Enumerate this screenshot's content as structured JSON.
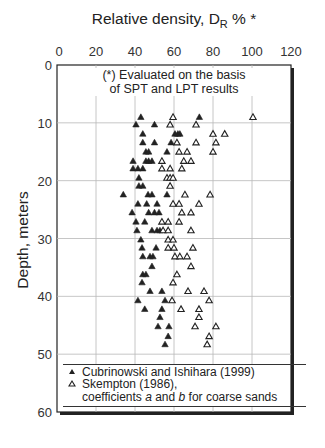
{
  "chart_data": {
    "type": "scatter",
    "title_main": "Relative density, D",
    "title_sub": "R",
    "title_suffix": " % *",
    "xlabel": "Relative density, D_R % *",
    "ylabel": "Depth, meters",
    "xlim": [
      0,
      120
    ],
    "ylim": [
      60,
      0
    ],
    "x_axis_position": "top",
    "y_inverted": true,
    "xticks": [
      0,
      20,
      40,
      60,
      80,
      100,
      120
    ],
    "yticks": [
      0,
      10,
      20,
      30,
      40,
      50,
      60
    ],
    "grid": true,
    "annotation": [
      "(*) Evaluated on the basis",
      "of SPT and LPT results"
    ],
    "legend_position": "bottom-inside",
    "legend": [
      {
        "marker": "filled-triangle",
        "label": "Cubrinowski and Ishihara (1999)"
      },
      {
        "marker": "hollow-triangle",
        "label": "Skempton (1986),",
        "label2_parts": [
          "coefficients ",
          "a",
          " and ",
          "b",
          " for coarse sands"
        ]
      }
    ],
    "series": [
      {
        "name": "Cubrinowski and Ishihara (1999)",
        "marker": "filled-triangle",
        "color": "#222222",
        "points": [
          [
            43,
            9.0
          ],
          [
            73,
            9.0
          ],
          [
            40.5,
            10.3
          ],
          [
            50,
            10.3
          ],
          [
            44,
            11.9
          ],
          [
            60.5,
            11.9
          ],
          [
            62,
            11.9
          ],
          [
            63,
            11.9
          ],
          [
            44,
            13.4
          ],
          [
            50,
            13.4
          ],
          [
            58.5,
            13.4
          ],
          [
            45.6,
            15.0
          ],
          [
            47,
            15.0
          ],
          [
            56.4,
            15.0
          ],
          [
            39,
            16.6
          ],
          [
            45.6,
            16.6
          ],
          [
            47,
            16.6
          ],
          [
            48.7,
            16.6
          ],
          [
            39,
            17.9
          ],
          [
            41.5,
            17.9
          ],
          [
            44,
            17.9
          ],
          [
            42,
            19.5
          ],
          [
            42,
            20.9
          ],
          [
            44,
            20.9
          ],
          [
            34,
            22.4
          ],
          [
            46.7,
            22.4
          ],
          [
            48.7,
            22.4
          ],
          [
            56.4,
            22.4
          ],
          [
            41.5,
            24.0
          ],
          [
            46,
            24.0
          ],
          [
            51.3,
            24.0
          ],
          [
            38.5,
            25.5
          ],
          [
            47,
            25.5
          ],
          [
            50,
            25.5
          ],
          [
            52.3,
            25.5
          ],
          [
            40.5,
            27.1
          ],
          [
            45,
            27.1
          ],
          [
            41,
            28.6
          ],
          [
            48.7,
            28.6
          ],
          [
            51.3,
            28.6
          ],
          [
            52.8,
            28.6
          ],
          [
            43,
            30.2
          ],
          [
            43.6,
            31.6
          ],
          [
            50.8,
            31.6
          ],
          [
            44,
            33.1
          ],
          [
            47.7,
            33.1
          ],
          [
            49.2,
            33.1
          ],
          [
            48.7,
            34.8
          ],
          [
            44,
            36.2
          ],
          [
            45.6,
            36.2
          ],
          [
            43.6,
            37.6
          ],
          [
            47.7,
            39.1
          ],
          [
            53.8,
            39.1
          ],
          [
            41.5,
            40.7
          ],
          [
            55.4,
            40.7
          ],
          [
            45,
            42.2
          ],
          [
            53.8,
            42.2
          ],
          [
            52.8,
            43.6
          ],
          [
            51.8,
            45.2
          ],
          [
            57.4,
            45.2
          ],
          [
            57,
            46.9
          ],
          [
            55.4,
            48.3
          ]
        ]
      },
      {
        "name": "Skempton (1986), coefficients a and b for coarse sands",
        "marker": "hollow-triangle",
        "color": "#222222",
        "points": [
          [
            59.5,
            9.0
          ],
          [
            100.5,
            9.0
          ],
          [
            58,
            10.3
          ],
          [
            71.3,
            10.3
          ],
          [
            80,
            11.9
          ],
          [
            86,
            11.9
          ],
          [
            61.5,
            13.4
          ],
          [
            71.3,
            13.4
          ],
          [
            81.5,
            13.4
          ],
          [
            62.6,
            15.0
          ],
          [
            66.7,
            15.0
          ],
          [
            80,
            15.0
          ],
          [
            53.8,
            16.6
          ],
          [
            65,
            16.6
          ],
          [
            68.7,
            16.6
          ],
          [
            53.8,
            17.9
          ],
          [
            58,
            17.9
          ],
          [
            64,
            17.9
          ],
          [
            56.4,
            19.5
          ],
          [
            58,
            19.5
          ],
          [
            59.5,
            19.5
          ],
          [
            58,
            20.9
          ],
          [
            65.6,
            22.4
          ],
          [
            78.5,
            22.4
          ],
          [
            59.5,
            24.0
          ],
          [
            62.6,
            24.0
          ],
          [
            72.8,
            24.0
          ],
          [
            64,
            25.5
          ],
          [
            68.7,
            25.5
          ],
          [
            53.8,
            27.1
          ],
          [
            57,
            27.1
          ],
          [
            62.6,
            27.1
          ],
          [
            54.4,
            28.6
          ],
          [
            57,
            28.6
          ],
          [
            68.7,
            28.6
          ],
          [
            57,
            30.2
          ],
          [
            59.5,
            30.2
          ],
          [
            57,
            31.6
          ],
          [
            60,
            31.6
          ],
          [
            69.7,
            31.6
          ],
          [
            60.5,
            33.1
          ],
          [
            63,
            33.1
          ],
          [
            66.7,
            33.1
          ],
          [
            68.7,
            34.8
          ],
          [
            61.5,
            36.2
          ],
          [
            59.5,
            37.6
          ],
          [
            67.2,
            39.1
          ],
          [
            75.4,
            39.1
          ],
          [
            59,
            40.7
          ],
          [
            78,
            40.7
          ],
          [
            63.6,
            42.2
          ],
          [
            72.8,
            42.2
          ],
          [
            72.8,
            43.6
          ],
          [
            70.8,
            45.2
          ],
          [
            81.5,
            45.2
          ],
          [
            78,
            46.9
          ],
          [
            77,
            48.3
          ]
        ]
      }
    ]
  }
}
